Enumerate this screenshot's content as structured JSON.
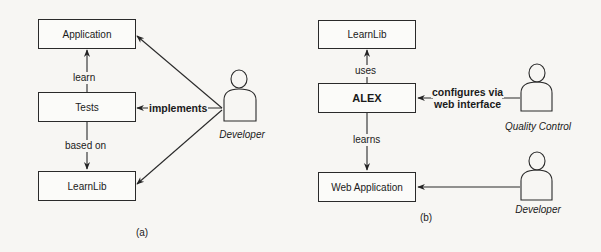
{
  "panel_a": {
    "caption": "(a)",
    "nodes": {
      "application": "Application",
      "tests": "Tests",
      "learnlib": "LearnLib"
    },
    "edges": {
      "tests_to_application": "learn",
      "tests_to_learnlib": "based on",
      "developer_to_tests": "implements"
    },
    "actors": {
      "developer": "Developer"
    }
  },
  "panel_b": {
    "caption": "(b)",
    "nodes": {
      "learnlib": "LearnLib",
      "alex": "ALEX",
      "web_application": "Web Application"
    },
    "edges": {
      "alex_to_learnlib": "uses",
      "alex_to_webapp": "learns",
      "qc_to_alex_line1": "configures via",
      "qc_to_alex_line2": "web interface"
    },
    "actors": {
      "quality_control": "Quality Control",
      "developer": "Developer"
    }
  }
}
